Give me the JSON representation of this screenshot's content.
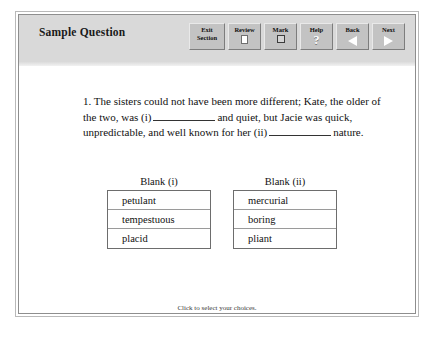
{
  "header": {
    "title": "Sample Question",
    "band_color": "#d9d9d9",
    "buttons": [
      {
        "label_line1": "Exit",
        "label_line2": "Section",
        "icon": "none",
        "name": "exit-section"
      },
      {
        "label_line1": "Review",
        "label_line2": "",
        "icon": "page-icon",
        "name": "review"
      },
      {
        "label_line1": "Mark",
        "label_line2": "",
        "icon": "checkbox-icon",
        "name": "mark"
      },
      {
        "label_line1": "Help",
        "label_line2": "",
        "icon": "question-mark-icon",
        "name": "help"
      },
      {
        "label_line1": "Back",
        "label_line2": "",
        "icon": "triangle-left-icon",
        "name": "back"
      },
      {
        "label_line1": "Next",
        "label_line2": "",
        "icon": "triangle-right-icon",
        "name": "next"
      }
    ]
  },
  "question": {
    "number": "1.",
    "segment_1": "The sisters could not have been more different; Kate, the older of the two, was (i)",
    "segment_2": "and quiet, but Jacie was quick, unpredictable, and well known for her (ii)",
    "segment_3": "nature."
  },
  "choices": [
    {
      "header": "Blank (i)",
      "options": [
        "petulant",
        "tempestuous",
        "placid"
      ]
    },
    {
      "header": "Blank (ii)",
      "options": [
        "mercurial",
        "boring",
        "pliant"
      ]
    }
  ],
  "footer": {
    "hint": "Click to select your choices."
  }
}
